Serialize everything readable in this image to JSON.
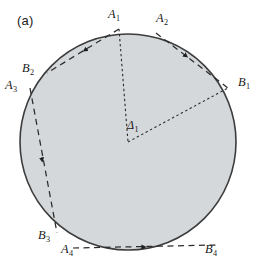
{
  "figure": {
    "panel_label": "(a)",
    "background_color": "#ffffff",
    "disk_fill_color": "#d4d8db",
    "disk_stroke_color": "#3c3c3c",
    "line_color": "#2b2b2b",
    "label_color": "#1b1b1b",
    "disk": {
      "cx": 128,
      "cy": 142,
      "r": 108
    }
  },
  "labels": {
    "A1": {
      "base": "A",
      "sub": "1",
      "x": 108,
      "y": 8
    },
    "A2": {
      "base": "A",
      "sub": "2",
      "x": 156,
      "y": 12
    },
    "A3": {
      "base": "A",
      "sub": "3",
      "x": 5,
      "y": 79
    },
    "A4": {
      "base": "A",
      "sub": "4",
      "x": 61,
      "y": 243
    },
    "B1": {
      "base": "B",
      "sub": "1",
      "x": 238,
      "y": 76
    },
    "B2": {
      "base": "B",
      "sub": "2",
      "x": 22,
      "y": 62
    },
    "B3": {
      "base": "B",
      "sub": "3",
      "x": 38,
      "y": 229
    },
    "B4": {
      "base": "B",
      "sub": "4",
      "x": 205,
      "y": 243
    },
    "D1": {
      "base": "Δ",
      "sub": "1",
      "x": 127,
      "y": 119
    }
  },
  "points": {
    "A1": {
      "x": 119,
      "y": 29
    },
    "A2": {
      "x": 156,
      "y": 33
    },
    "A3": {
      "x": 30,
      "y": 88
    },
    "A4": {
      "x": 73,
      "y": 248
    },
    "B1": {
      "x": 228,
      "y": 88
    },
    "B2": {
      "x": 47,
      "y": 73
    },
    "B3": {
      "x": 57,
      "y": 233
    },
    "B4": {
      "x": 216,
      "y": 245
    },
    "center": {
      "x": 128,
      "y": 142
    }
  },
  "segments": [
    {
      "name": "A1-to-B2",
      "from": "A1",
      "to": "B2",
      "style": "dashed",
      "arrow": "mid",
      "direction": "toward-B2"
    },
    {
      "name": "A2-to-B1",
      "from": "A2",
      "to": "B1",
      "style": "dashed",
      "arrow": "mid",
      "direction": "toward-B1"
    },
    {
      "name": "A3-to-B3",
      "from": "A3",
      "to": "B3",
      "style": "dashed",
      "arrow": "mid",
      "direction": "toward-B3"
    },
    {
      "name": "A4-to-B4",
      "from": "A4",
      "to": "B4",
      "style": "dashed",
      "arrow": "mid",
      "direction": "toward-B4"
    },
    {
      "name": "A1-to-center",
      "from": "A1",
      "to": "center",
      "style": "dotted",
      "arrow": "none"
    },
    {
      "name": "center-to-B1",
      "from": "center",
      "to": "B1",
      "style": "dotted",
      "arrow": "none"
    }
  ]
}
